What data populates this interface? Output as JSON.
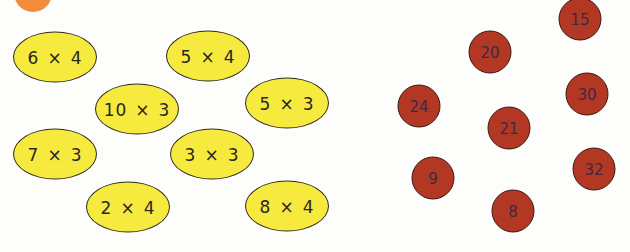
{
  "badge": {
    "color": "#f08c3a"
  },
  "colors": {
    "ellipse_fill": "#f7ea3f",
    "ellipse_border": "#2d2a1e",
    "circle_fill": "#b33824",
    "circle_text": "#3b2a45"
  },
  "expressions": [
    {
      "a": "6",
      "op": "×",
      "b": "4",
      "cx": 55,
      "cy": 57
    },
    {
      "a": "5",
      "op": "×",
      "b": "4",
      "cx": 208,
      "cy": 56
    },
    {
      "a": "10",
      "op": "×",
      "b": "3",
      "cx": 137,
      "cy": 109
    },
    {
      "a": "5",
      "op": "×",
      "b": "3",
      "cx": 287,
      "cy": 103
    },
    {
      "a": "7",
      "op": "×",
      "b": "3",
      "cx": 55,
      "cy": 154
    },
    {
      "a": "3",
      "op": "×",
      "b": "3",
      "cx": 212,
      "cy": 154
    },
    {
      "a": "2",
      "op": "×",
      "b": "4",
      "cx": 128,
      "cy": 207
    },
    {
      "a": "8",
      "op": "×",
      "b": "4",
      "cx": 287,
      "cy": 206
    }
  ],
  "answers": [
    {
      "value": "15",
      "cx": 580,
      "cy": 19
    },
    {
      "value": "20",
      "cx": 490,
      "cy": 52
    },
    {
      "value": "24",
      "cx": 419,
      "cy": 106
    },
    {
      "value": "30",
      "cx": 587,
      "cy": 94
    },
    {
      "value": "21",
      "cx": 509,
      "cy": 128
    },
    {
      "value": "9",
      "cx": 433,
      "cy": 178
    },
    {
      "value": "32",
      "cx": 594,
      "cy": 169
    },
    {
      "value": "8",
      "cx": 513,
      "cy": 211
    }
  ]
}
